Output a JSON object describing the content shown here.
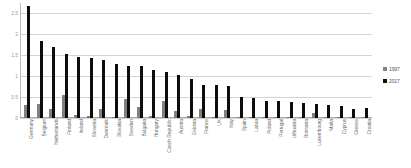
{
  "chart_data": {
    "type": "bar",
    "title": "",
    "subtitle": "",
    "xlabel": "",
    "ylabel": "",
    "ylim": [
      0,
      2.75
    ],
    "grid": true,
    "legend_position": "right",
    "yticks": [
      0,
      0.5,
      1,
      1.5,
      2,
      2.5
    ],
    "ytick_labels": [
      "0",
      "0.5",
      "1",
      "1.5",
      "2",
      "2.5"
    ],
    "categories": [
      "Germany",
      "Belgium",
      "Netherlands",
      "Finland",
      "Ireland",
      "Slovenia",
      "Denmark",
      "Slovakia",
      "Sweden",
      "Bulgaria",
      "Hungary",
      "Czech Republic",
      "Austria",
      "Estonia",
      "France",
      "UK",
      "Italy",
      "Spain",
      "Latvia",
      "Poland",
      "Portugal",
      "Lithuania",
      "Romania",
      "Luxembourg",
      "Malta",
      "Cyprus",
      "Greece",
      "Croatia"
    ],
    "series": [
      {
        "name": "1997",
        "color": "#808080",
        "values": [
          0.3,
          0.33,
          0.22,
          0.55,
          0.07,
          0.06,
          0.21,
          0.03,
          0.45,
          0.27,
          0.04,
          0.41,
          0.17,
          0.05,
          0.22,
          0.02,
          0.2,
          0.03,
          0.02,
          0.02,
          0.02,
          0.02,
          0.02,
          0.12,
          0.02,
          0.02,
          0.02,
          0.02
        ]
      },
      {
        "name": "2017",
        "color": "#0d0d0d",
        "values": [
          2.68,
          1.85,
          1.69,
          1.54,
          1.46,
          1.43,
          1.38,
          1.28,
          1.24,
          1.24,
          1.15,
          1.09,
          1.04,
          0.93,
          0.79,
          0.79,
          0.77,
          0.5,
          0.47,
          0.4,
          0.4,
          0.39,
          0.37,
          0.33,
          0.3,
          0.28,
          0.22,
          0.23
        ]
      }
    ]
  },
  "legend": {
    "items": [
      {
        "label": "1997",
        "color": "#808080"
      },
      {
        "label": "2017",
        "color": "#0d0d0d"
      }
    ]
  }
}
